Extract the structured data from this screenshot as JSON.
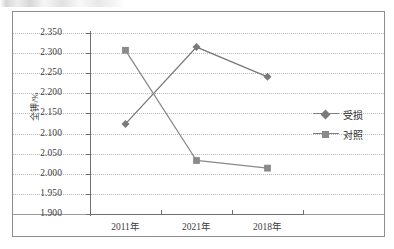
{
  "chart_data": {
    "type": "line",
    "title": "",
    "xlabel": "",
    "ylabel": "全钾/%",
    "categories": [
      "2011年",
      "2021年",
      "2018年"
    ],
    "ylim": [
      1.9,
      2.35
    ],
    "ytick_step": 0.05,
    "yticks": [
      "2.350",
      "2.300",
      "2.250",
      "2.200",
      "2.150",
      "2.100",
      "2.050",
      "2.000",
      "1.950",
      "1.900"
    ],
    "ytick_values": [
      2.35,
      2.3,
      2.25,
      2.2,
      2.15,
      2.1,
      2.05,
      2.0,
      1.95,
      1.9
    ],
    "grid": true,
    "legend_position": "right",
    "series": [
      {
        "name": "受损",
        "marker": "diamond",
        "color": "#7a7a7a",
        "values": [
          2.124,
          2.315,
          2.241
        ]
      },
      {
        "name": "对照",
        "marker": "square",
        "color": "#8a8a8a",
        "values": [
          2.307,
          2.033,
          2.014
        ]
      }
    ]
  },
  "legend": {
    "items": [
      {
        "label": "受损",
        "marker": "diamond-marker-icon"
      },
      {
        "label": "对照",
        "marker": "square-marker-icon"
      }
    ]
  },
  "axes": {
    "y_title": "全钾/%",
    "y_labels": [
      "2.350",
      "2.300",
      "2.250",
      "2.200",
      "2.150",
      "2.100",
      "2.050",
      "2.000",
      "1.950",
      "1.900"
    ],
    "x_labels": [
      "2011年",
      "2021年",
      "2018年"
    ]
  }
}
